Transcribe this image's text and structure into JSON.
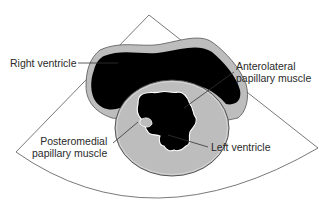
{
  "figure": {
    "type": "echocardiogram-schematic",
    "view": "parasternal short-axis sector"
  },
  "labels": {
    "right_ventricle": "Right ventricle",
    "anterolateral_line1": "Anterolateral",
    "anterolateral_line2": "papillary muscle",
    "posteromedial_line1": "Posteromedial",
    "posteromedial_line2": "papillary muscle",
    "left_ventricle": "Left ventricle"
  },
  "colors": {
    "background": "#ffffff",
    "sector_outline": "#666666",
    "myocardium": "#bdbdbd",
    "cavity": "#000000",
    "leader_line": "#333333",
    "text": "#2a2a2a"
  }
}
